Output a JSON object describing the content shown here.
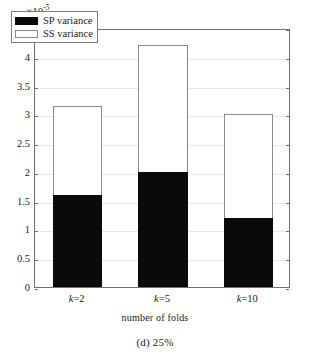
{
  "figure": {
    "caption": "(d) 25%",
    "exponent_prefix": "×10",
    "exponent_power": "-5"
  },
  "legend": {
    "items": [
      {
        "label": "SP variance",
        "swatch": "black-swatch",
        "color": "#0a0a0a"
      },
      {
        "label": "SS variance",
        "swatch": "white-swatch",
        "color": "#ffffff"
      }
    ]
  },
  "chart_data": {
    "type": "bar",
    "title": "",
    "subtitle": "(d) 25%",
    "xlabel": "number of folds",
    "ylabel": "variance",
    "y_multiplier": "×10^-5",
    "categories": [
      "k=2",
      "k=5",
      "k=10"
    ],
    "series": [
      {
        "name": "SP variance",
        "values": [
          1.6,
          2.0,
          1.2
        ],
        "color": "#0a0a0a"
      },
      {
        "name": "SS variance",
        "values": [
          3.15,
          4.2,
          3.0
        ],
        "color": "#ffffff"
      }
    ],
    "stacking": "overlaid",
    "ylim": [
      0,
      4.5
    ],
    "yticks": [
      0,
      0.5,
      1,
      1.5,
      2,
      2.5,
      3,
      3.5,
      4,
      4.5
    ],
    "ytick_labels": [
      "0",
      "0.5",
      "1",
      "1.5",
      "2",
      "2.5",
      "3",
      "3.5",
      "4",
      "4.5"
    ],
    "grid": true,
    "legend_position": "top-left"
  },
  "axes": {
    "y": {
      "label": "variance",
      "ticks": [
        {
          "value": 4.5,
          "label": "4.5"
        },
        {
          "value": 4,
          "label": "4"
        },
        {
          "value": 3.5,
          "label": "3.5"
        },
        {
          "value": 3,
          "label": "3"
        },
        {
          "value": 2.5,
          "label": "2.5"
        },
        {
          "value": 2,
          "label": "2"
        },
        {
          "value": 1.5,
          "label": "1.5"
        },
        {
          "value": 1,
          "label": "1"
        },
        {
          "value": 0.5,
          "label": "0.5"
        },
        {
          "value": 0,
          "label": "0"
        }
      ]
    },
    "x": {
      "label": "number of folds",
      "ticks": [
        {
          "prefix": "k",
          "suffix": "=2"
        },
        {
          "prefix": "k",
          "suffix": "=5"
        },
        {
          "prefix": "k",
          "suffix": "=10"
        }
      ]
    }
  }
}
